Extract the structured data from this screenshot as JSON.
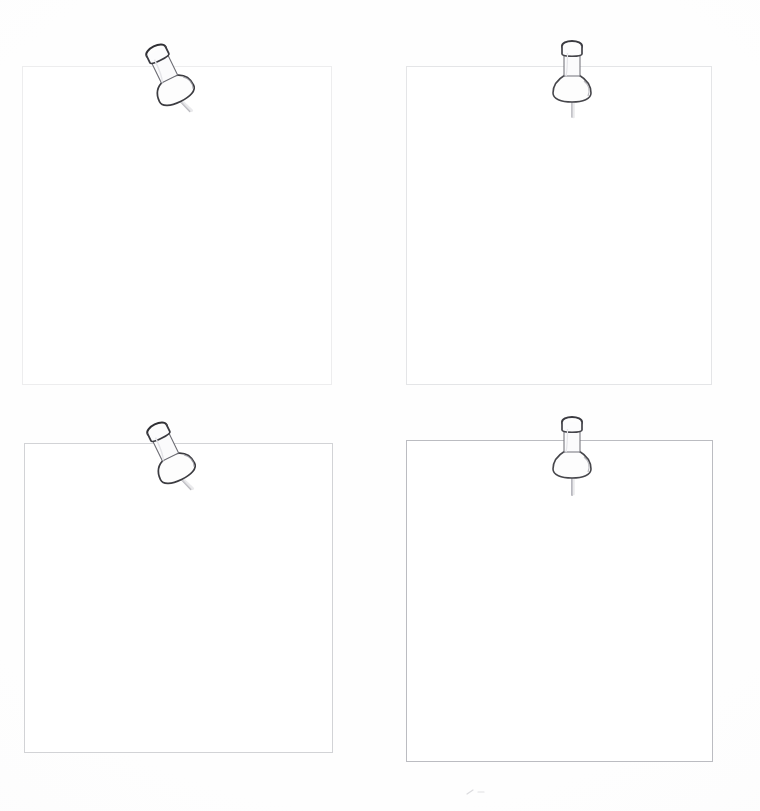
{
  "board": {
    "title": "Pinned Notes Board",
    "background_color": "#fefefe",
    "sheet_color": "#ffffff",
    "paper_mark": "paper-smudge"
  },
  "notes": [
    {
      "id": "note-top-left",
      "name": "note-card-top-left",
      "position": "top-left",
      "text": "",
      "placeholder": "",
      "border_color": "#8c9098",
      "background_color": "#ffffff",
      "x": 22,
      "y": 66,
      "width": 310,
      "height": 319,
      "pin": {
        "name": "pushpin-top-left",
        "icon": "pushpin-icon",
        "orientation": "tilted",
        "tilt_degrees": -26,
        "outline_color": "#3c3c41",
        "x": 118,
        "y": 26
      }
    },
    {
      "id": "note-top-right",
      "name": "note-card-top-right",
      "position": "top-right",
      "text": "",
      "placeholder": "",
      "border_color": "#868a92",
      "background_color": "#ffffff",
      "x": 406,
      "y": 66,
      "width": 306,
      "height": 319,
      "pin": {
        "name": "pushpin-top-right",
        "icon": "pushpin-icon",
        "orientation": "upright",
        "tilt_degrees": 0,
        "outline_color": "#46464b",
        "x": 524,
        "y": 24
      }
    },
    {
      "id": "note-bottom-left",
      "name": "note-card-bottom-left",
      "position": "bottom-left",
      "text": "",
      "placeholder": "",
      "border_color": "#7a7e86",
      "background_color": "#ffffff",
      "x": 24,
      "y": 443,
      "width": 309,
      "height": 310,
      "pin": {
        "name": "pushpin-bottom-left",
        "icon": "pushpin-icon",
        "orientation": "tilted",
        "tilt_degrees": -26,
        "outline_color": "#3c3c41",
        "x": 119,
        "y": 404
      }
    },
    {
      "id": "note-bottom-right",
      "name": "note-card-bottom-right",
      "position": "bottom-right",
      "text": "",
      "placeholder": "",
      "border_color": "#70747e",
      "background_color": "#ffffff",
      "x": 406,
      "y": 440,
      "width": 307,
      "height": 322,
      "pin": {
        "name": "pushpin-bottom-right",
        "icon": "pushpin-icon",
        "orientation": "upright",
        "tilt_degrees": 0,
        "outline_color": "#46464b",
        "x": 524,
        "y": 400
      }
    }
  ]
}
